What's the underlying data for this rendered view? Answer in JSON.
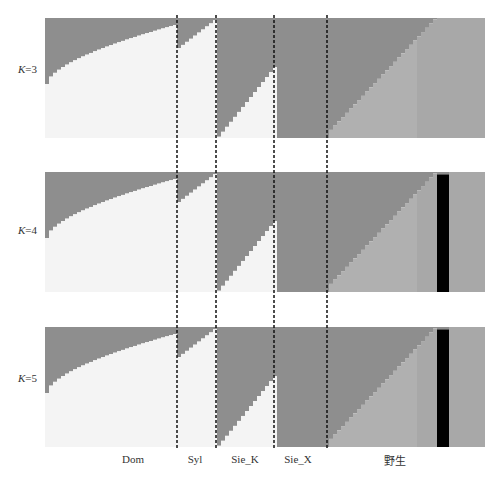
{
  "chart_data": {
    "type": "bar",
    "subtype": "stacked-admixture (STRUCTURE plot)",
    "title": "",
    "panels": [
      {
        "label": "K=3",
        "K": 3
      },
      {
        "label": "K=4",
        "K": 4
      },
      {
        "label": "K=5",
        "K": 5
      }
    ],
    "groups": [
      "Dom",
      "Syl",
      "Sie_K",
      "Sie_X",
      "野生"
    ],
    "group_boundaries_px": [
      177,
      216,
      274,
      327
    ],
    "colors": {
      "cluster_dark_gray": "#8e8e8e",
      "cluster_white": "#f4f4f4",
      "cluster_mid_gray": "#b0b0b0",
      "cluster_black": "#000000",
      "cluster_light_gray": "#a8a8a8"
    },
    "xlabel": "",
    "ylabel": "",
    "ylim": [
      0,
      1
    ],
    "dashed_separators": true
  },
  "labels": {
    "k3": "K=3",
    "k4": "K=4",
    "k5": "K=5",
    "groups": [
      "Dom",
      "Syl",
      "Sie_K",
      "Sie_X",
      "野生"
    ]
  }
}
